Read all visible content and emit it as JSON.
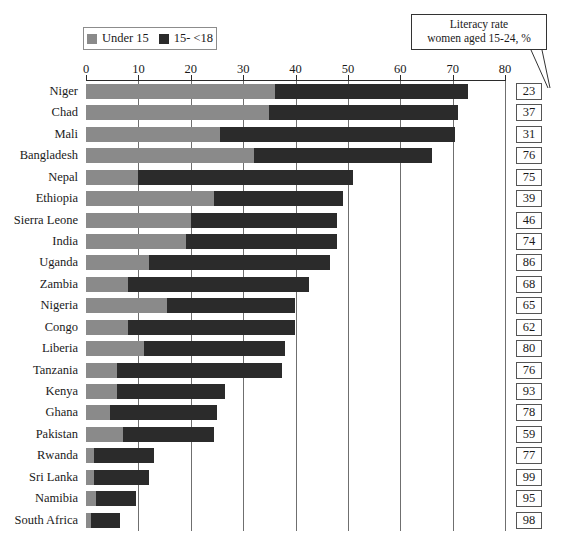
{
  "legend": {
    "items": [
      {
        "label": "Under 15",
        "color": "#8a8a8a",
        "icon": "square-swatch"
      },
      {
        "label": "15- <18",
        "color": "#2b2b2b",
        "icon": "square-swatch"
      }
    ]
  },
  "annotation": {
    "line1": "Literacy rate",
    "line2": "women aged 15-24, %"
  },
  "chart_data": {
    "type": "bar",
    "orientation": "horizontal",
    "stacked": true,
    "title": "",
    "subtitle": "",
    "xlabel": "",
    "ylabel": "",
    "xlim": [
      0,
      80
    ],
    "xticks": [
      0,
      10,
      20,
      30,
      40,
      50,
      60,
      70,
      80
    ],
    "grid": "vertical",
    "legend_position": "top-left",
    "categories": [
      "Niger",
      "Chad",
      "Mali",
      "Bangladesh",
      "Nepal",
      "Ethiopia",
      "Sierra Leone",
      "India",
      "Uganda",
      "Zambia",
      "Nigeria",
      "Congo",
      "Liberia",
      "Tanzania",
      "Kenya",
      "Ghana",
      "Pakistan",
      "Rwanda",
      "Sri Lanka",
      "Namibia",
      "South Africa"
    ],
    "series": [
      {
        "name": "Under 15",
        "color": "#8a8a8a",
        "values": [
          36,
          35,
          25.5,
          32,
          10,
          24.5,
          20,
          19,
          12,
          8,
          15.5,
          8,
          11,
          6,
          6,
          4.5,
          7,
          1.5,
          1.5,
          2,
          1
        ]
      },
      {
        "name": "15- <18",
        "color": "#2b2b2b",
        "values": [
          37,
          36,
          45,
          34,
          41,
          24.5,
          28,
          29,
          34.5,
          34.5,
          24.5,
          32,
          27,
          31.5,
          20.5,
          20.5,
          17.5,
          11.5,
          10.5,
          7.5,
          5.5
        ]
      }
    ],
    "totals": [
      73,
      71,
      70.5,
      66,
      51,
      49,
      48,
      48,
      46.5,
      42.5,
      40,
      40,
      38,
      37.5,
      26.5,
      25,
      24.5,
      13,
      12,
      9.5,
      6.5
    ],
    "annotation_series": {
      "name": "Literacy rate women aged 15-24, %",
      "values": [
        23,
        37,
        31,
        76,
        75,
        39,
        46,
        74,
        86,
        68,
        65,
        62,
        80,
        76,
        93,
        78,
        59,
        77,
        99,
        95,
        98
      ]
    }
  }
}
